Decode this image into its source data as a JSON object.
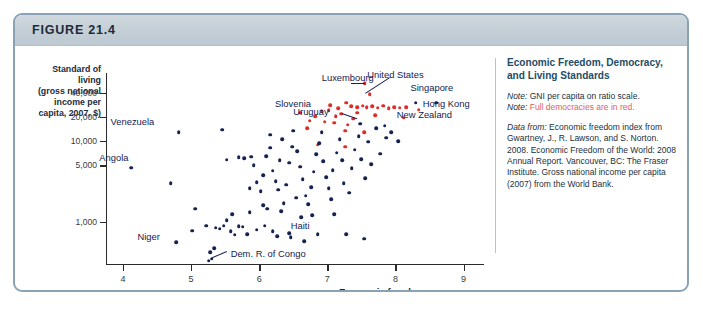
{
  "figure": {
    "number_label": "FIGURE 21.4"
  },
  "side_panel": {
    "title": "Economic Freedom, Democracy, and Living Standards",
    "note_1_prefix": "Note:",
    "note_1_text": "GNI per capita on ratio scale.",
    "note_2_prefix": "Note:",
    "note_2_text": "Full democracies are in red.",
    "data_from_prefix": "Data from:",
    "data_from_text": "Economic freedom index from Gwartney, J., R. Lawson, and S. Norton. 2008. Economic Freedom of the World: 2008 Annual Report. Vancouver, BC: The Fraser Institute. Gross national income per capita (2007) from the World Bank.",
    "separator_color": "#b7c3cc",
    "title_color": "#1f4d66",
    "red_color": "#e0625a"
  },
  "chart_data": {
    "type": "scatter",
    "title": "Economic Freedom, Democracy, and Living Standards",
    "xlabel": "Economic freedom",
    "ylabel": "Standard of living (gross national income per capita, 2007, $)",
    "ylabel_lines": [
      "Standard of living",
      "(gross national",
      "income per",
      "capita, 2007, $)"
    ],
    "xlim": [
      3.75,
      9.3
    ],
    "ylim_log": [
      300,
      70000
    ],
    "yscale": "log",
    "grid": false,
    "legend": "none",
    "xticks": [
      4,
      5,
      6,
      7,
      8,
      9
    ],
    "xtick_labels": [
      "4",
      "5",
      "6",
      "7",
      "8",
      "9"
    ],
    "yticks": [
      1000,
      5000,
      10000,
      20000,
      40000
    ],
    "ytick_labels": [
      "1,000",
      "5,000",
      "10,000",
      "20,000",
      "40,000"
    ],
    "series": [
      {
        "name": "Full democracies",
        "color": "#e02b26",
        "points": [
          [
            7.55,
            52000
          ],
          [
            7.62,
            38000
          ],
          [
            7.28,
            30000
          ],
          [
            7.16,
            25500
          ],
          [
            7.02,
            24000
          ],
          [
            6.92,
            23500
          ],
          [
            7.35,
            27000
          ],
          [
            7.44,
            26500
          ],
          [
            7.52,
            27500
          ],
          [
            7.58,
            26500
          ],
          [
            7.66,
            27000
          ],
          [
            7.74,
            26000
          ],
          [
            7.82,
            27500
          ],
          [
            7.9,
            25500
          ],
          [
            7.98,
            26500
          ],
          [
            8.06,
            26000
          ],
          [
            8.16,
            26500
          ],
          [
            8.34,
            24500
          ],
          [
            8.12,
            19500
          ],
          [
            6.82,
            20500
          ],
          [
            6.74,
            18000
          ],
          [
            6.96,
            17500
          ],
          [
            7.1,
            17000
          ],
          [
            7.3,
            16000
          ],
          [
            6.7,
            14500
          ],
          [
            7.2,
            22000
          ],
          [
            7.44,
            22500
          ],
          [
            7.12,
            20500
          ],
          [
            7.26,
            13500
          ],
          [
            7.54,
            13000
          ],
          [
            6.86,
            9000
          ],
          [
            7.26,
            8500
          ],
          [
            6.6,
            22500
          ],
          [
            7.38,
            19000
          ],
          [
            7.7,
            21000
          ],
          [
            7.04,
            28000
          ]
        ]
      },
      {
        "name": "Other countries",
        "color": "#16224f",
        "points": [
          [
            4.12,
            4700
          ],
          [
            4.82,
            13000
          ],
          [
            4.7,
            3000
          ],
          [
            4.78,
            560
          ],
          [
            5.06,
            1450
          ],
          [
            5.02,
            780
          ],
          [
            5.26,
            330
          ],
          [
            5.3,
            350
          ],
          [
            5.28,
            420
          ],
          [
            5.22,
            900
          ],
          [
            5.36,
            850
          ],
          [
            5.42,
            820
          ],
          [
            5.48,
            900
          ],
          [
            5.52,
            1050
          ],
          [
            5.58,
            760
          ],
          [
            5.64,
            690
          ],
          [
            5.7,
            880
          ],
          [
            5.76,
            870
          ],
          [
            5.82,
            700
          ],
          [
            5.46,
            13800
          ],
          [
            5.7,
            6300
          ],
          [
            5.78,
            6100
          ],
          [
            5.88,
            6400
          ],
          [
            5.92,
            5000
          ],
          [
            5.96,
            3100
          ],
          [
            6.02,
            2400
          ],
          [
            6.06,
            1600
          ],
          [
            6.12,
            1450
          ],
          [
            6.1,
            6500
          ],
          [
            6.16,
            8300
          ],
          [
            6.2,
            4300
          ],
          [
            6.24,
            3200
          ],
          [
            6.28,
            2500
          ],
          [
            6.32,
            1350
          ],
          [
            6.36,
            1700
          ],
          [
            6.4,
            2900
          ],
          [
            6.44,
            5400
          ],
          [
            6.48,
            8500
          ],
          [
            6.5,
            13500
          ],
          [
            6.56,
            7500
          ],
          [
            6.6,
            4800
          ],
          [
            6.64,
            3400
          ],
          [
            6.68,
            2100
          ],
          [
            6.72,
            1650
          ],
          [
            6.76,
            2700
          ],
          [
            6.8,
            4200
          ],
          [
            6.84,
            6900
          ],
          [
            6.88,
            9500
          ],
          [
            6.94,
            5600
          ],
          [
            6.98,
            3600
          ],
          [
            7.02,
            2600
          ],
          [
            7.06,
            1900
          ],
          [
            7.08,
            4400
          ],
          [
            7.14,
            7200
          ],
          [
            7.18,
            10500
          ],
          [
            7.22,
            5800
          ],
          [
            7.24,
            3000
          ],
          [
            7.32,
            2300
          ],
          [
            7.36,
            4600
          ],
          [
            7.4,
            7800
          ],
          [
            7.46,
            11500
          ],
          [
            7.5,
            6000
          ],
          [
            7.56,
            3500
          ],
          [
            7.6,
            9800
          ],
          [
            7.64,
            5200
          ],
          [
            7.72,
            14500
          ],
          [
            7.78,
            7000
          ],
          [
            7.86,
            11000
          ],
          [
            7.94,
            13000
          ],
          [
            8.04,
            10000
          ],
          [
            8.3,
            30000
          ],
          [
            8.6,
            30000
          ],
          [
            6.44,
            720
          ],
          [
            6.2,
            760
          ],
          [
            5.96,
            800
          ],
          [
            6.62,
            1150
          ],
          [
            5.6,
            1250
          ],
          [
            5.86,
            1320
          ],
          [
            6.06,
            3800
          ],
          [
            6.3,
            5800
          ],
          [
            6.54,
            2000
          ],
          [
            6.78,
            1200
          ],
          [
            7.1,
            1250
          ],
          [
            6.92,
            13000
          ],
          [
            7.48,
            16500
          ],
          [
            7.84,
            15500
          ],
          [
            6.34,
            10500
          ],
          [
            6.16,
            12000
          ],
          [
            5.52,
            5900
          ],
          [
            5.86,
            2600
          ],
          [
            6.08,
            900
          ],
          [
            6.26,
            660
          ],
          [
            6.46,
            640
          ],
          [
            6.66,
            580
          ],
          [
            6.86,
            700
          ],
          [
            5.34,
            470
          ],
          [
            7.28,
            700
          ],
          [
            7.54,
            620
          ]
        ]
      }
    ],
    "annotations": [
      {
        "text": "Venezuela",
        "x": 4.46,
        "y": 17500,
        "anchor": "right"
      },
      {
        "text": "Angola",
        "x": 4.08,
        "y": 6200,
        "anchor": "right"
      },
      {
        "text": "Niger",
        "x": 4.54,
        "y": 640,
        "anchor": "right"
      },
      {
        "text": "Slovenia",
        "x": 6.76,
        "y": 28500,
        "anchor": "right"
      },
      {
        "text": "Uruguay",
        "x": 7.02,
        "y": 23000,
        "anchor": "right"
      },
      {
        "text": "Haiti",
        "x": 6.6,
        "y": 900,
        "anchor": "center"
      },
      {
        "text": "Dem. R. of Congo",
        "x": 5.58,
        "y": 400,
        "anchor": "left"
      },
      {
        "text": "Luxembourg",
        "x": 7.3,
        "y": 60000,
        "anchor": "center"
      },
      {
        "text": "United States",
        "x": 8.0,
        "y": 66000,
        "anchor": "center"
      },
      {
        "text": "Singapore",
        "x": 8.22,
        "y": 45000,
        "anchor": "left"
      },
      {
        "text": "Hong Kong",
        "x": 8.4,
        "y": 29000,
        "anchor": "left"
      },
      {
        "text": "New Zealand",
        "x": 8.02,
        "y": 21000,
        "anchor": "left"
      }
    ]
  }
}
